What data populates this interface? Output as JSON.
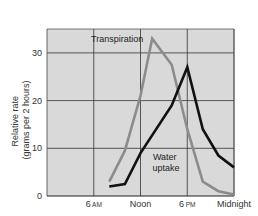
{
  "chart_data": {
    "type": "line",
    "title": "",
    "xlabel": "",
    "ylabel": "Relative rate (grams per 2 hours)",
    "ylabel_lines": [
      "Relative rate",
      "(grams per 2 hours)"
    ],
    "x_ticks": [
      {
        "hour": 6,
        "label": "6",
        "suffix": "AM"
      },
      {
        "hour": 12,
        "label": "Noon",
        "suffix": ""
      },
      {
        "hour": 18,
        "label": "6",
        "suffix": "PM"
      },
      {
        "hour": 24,
        "label": "Midnight",
        "suffix": ""
      }
    ],
    "y_ticks": [
      0,
      10,
      20,
      30
    ],
    "xlim": [
      0,
      24
    ],
    "ylim": [
      0,
      35
    ],
    "grid": true,
    "legend": "inline annotations",
    "colors": {
      "background": "#d9d9d9",
      "grid": "#333333",
      "transpiration": "#8c8c8c",
      "water_uptake": "#111111"
    },
    "series": [
      {
        "name": "Transpiration",
        "annotation": "Transpiration",
        "x": [
          8,
          10,
          12,
          13.5,
          16,
          18,
          20,
          22,
          24
        ],
        "values": [
          3,
          9.5,
          21,
          33,
          27.5,
          14,
          3,
          1,
          0.3
        ]
      },
      {
        "name": "Water uptake",
        "annotation": [
          "Water",
          "uptake"
        ],
        "x": [
          8,
          10,
          12,
          16,
          18,
          20,
          22,
          24
        ],
        "values": [
          2,
          2.5,
          9,
          19,
          27,
          14,
          8.5,
          6
        ]
      }
    ]
  }
}
